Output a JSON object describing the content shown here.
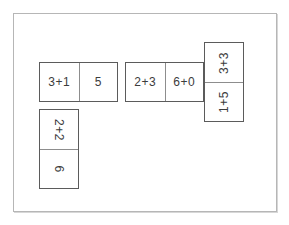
{
  "board": {
    "name": "domino-matching-board",
    "background_color": "#ffffff",
    "border_color": "#b6b6b6"
  },
  "style": {
    "tile_fill": "#ffffff",
    "tile_border_color": "#5b5b5b",
    "divider_color": "#8d8d8d",
    "text_color": "#3c3c3c"
  },
  "dominoes": [
    {
      "id": "domino-a",
      "orientation": "horizontal",
      "rotation": "none",
      "cells": [
        {
          "label": "3+1"
        },
        {
          "label": "5"
        }
      ]
    },
    {
      "id": "domino-b",
      "orientation": "horizontal",
      "rotation": "none",
      "cells": [
        {
          "label": "2+3"
        },
        {
          "label": "6+0"
        }
      ]
    },
    {
      "id": "domino-c",
      "orientation": "vertical",
      "rotation": "counter-clockwise-90",
      "cells": [
        {
          "label": "3+3"
        },
        {
          "label": "1+5"
        }
      ]
    },
    {
      "id": "domino-d",
      "orientation": "vertical",
      "rotation": "clockwise-90",
      "cells": [
        {
          "label": "2+2"
        },
        {
          "label": "6"
        }
      ]
    }
  ]
}
